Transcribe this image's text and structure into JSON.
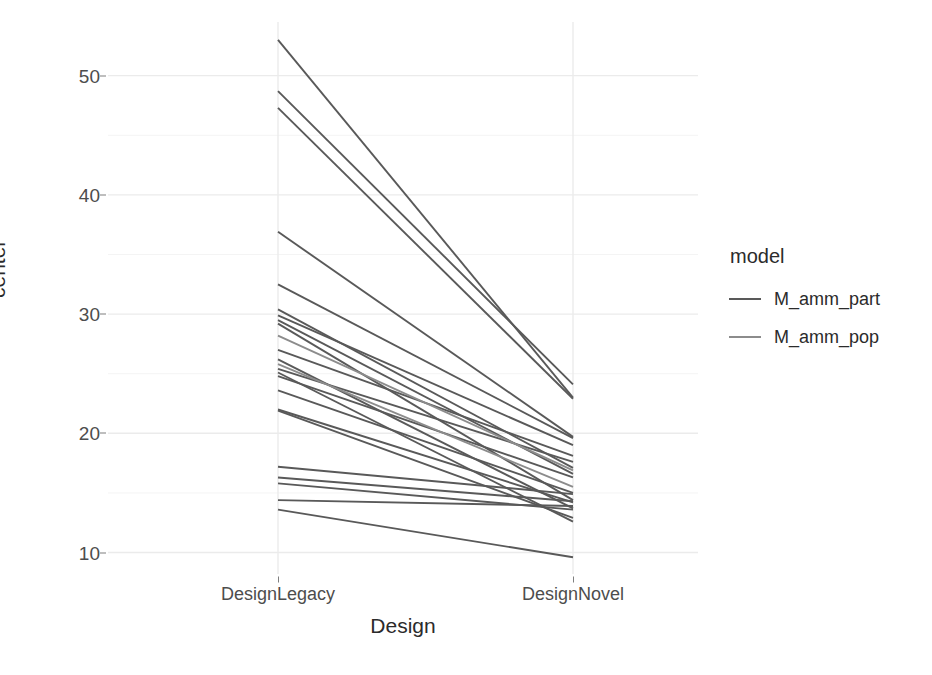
{
  "chart_data": {
    "type": "line",
    "title": "",
    "subtitle": "",
    "xlabel": "Design",
    "ylabel": "center",
    "categories": [
      "DesignLegacy",
      "DesignNovel"
    ],
    "x": [
      0,
      1
    ],
    "ylim": [
      8.2,
      54.5
    ],
    "y_ticks": [
      10,
      20,
      30,
      40,
      50
    ],
    "y_tick_labels": [
      "10",
      "20",
      "30",
      "40",
      "50"
    ],
    "y_minor_ticks": [
      15,
      25,
      35,
      45
    ],
    "grid": true,
    "grid_major_color": "#ebebeb",
    "grid_minor_color": "#f4f4f4",
    "legend_position": "right",
    "legend_title": "model",
    "legend_entries": [
      {
        "name": "M_amm_part",
        "color": "#595959"
      },
      {
        "name": "M_amm_pop",
        "color": "#8c8c8c"
      }
    ],
    "series": [
      {
        "name": "M_amm_part",
        "color": "#595959",
        "lines": [
          {
            "values": [
              53.0,
              23.0
            ]
          },
          {
            "values": [
              48.7,
              24.1
            ]
          },
          {
            "values": [
              47.3,
              22.9
            ]
          },
          {
            "values": [
              36.9,
              19.7
            ]
          },
          {
            "values": [
              32.5,
              19.6
            ]
          },
          {
            "values": [
              30.4,
              17.1
            ]
          },
          {
            "values": [
              29.9,
              19.0
            ]
          },
          {
            "values": [
              29.5,
              16.6
            ]
          },
          {
            "values": [
              29.2,
              14.4
            ]
          },
          {
            "values": [
              27.0,
              18.1
            ]
          },
          {
            "values": [
              26.2,
              13.7
            ]
          },
          {
            "values": [
              25.4,
              17.6
            ]
          },
          {
            "values": [
              25.1,
              12.6
            ]
          },
          {
            "values": [
              24.8,
              16.3
            ]
          },
          {
            "values": [
              23.6,
              15.0
            ]
          },
          {
            "values": [
              22.0,
              14.2
            ]
          },
          {
            "values": [
              21.9,
              12.9
            ]
          },
          {
            "values": [
              17.2,
              14.9
            ]
          },
          {
            "values": [
              16.3,
              14.3
            ]
          },
          {
            "values": [
              15.8,
              13.6
            ]
          },
          {
            "values": [
              14.4,
              13.9
            ]
          },
          {
            "values": [
              13.6,
              9.6
            ]
          }
        ]
      },
      {
        "name": "M_amm_pop",
        "color": "#8c8c8c",
        "lines": [
          {
            "values": [
              28.2,
              16.9
            ]
          },
          {
            "values": [
              25.8,
              15.5
            ]
          }
        ]
      }
    ]
  },
  "axis": {
    "y_label": "center",
    "x_label": "Design",
    "y_ticks": [
      "10",
      "20",
      "30",
      "40",
      "50"
    ],
    "x_ticks": [
      "DesignLegacy",
      "DesignNovel"
    ]
  },
  "legend": {
    "title": "model",
    "items": [
      {
        "label": "M_amm_part"
      },
      {
        "label": "M_amm_pop"
      }
    ]
  }
}
